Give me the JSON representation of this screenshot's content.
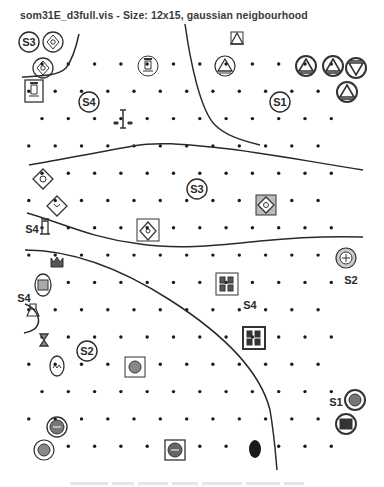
{
  "window": {
    "title": "som31E_d3full.vis - Size: 12x15, gaussian neigbourhood"
  },
  "map": {
    "grid_size": "12x15",
    "neighbourhood": "gaussian",
    "cluster_labels": [
      {
        "label": "S3",
        "x": 29,
        "y": 42,
        "circled": true
      },
      {
        "label": "S4",
        "x": 89,
        "y": 102,
        "circled": true
      },
      {
        "label": "S1",
        "x": 280,
        "y": 102,
        "circled": true
      },
      {
        "label": "S3",
        "x": 197,
        "y": 189,
        "circled": true
      },
      {
        "label": "S4",
        "x": 32,
        "y": 229,
        "circled": false
      },
      {
        "label": "S2",
        "x": 351,
        "y": 280,
        "circled": false
      },
      {
        "label": "S4",
        "x": 250,
        "y": 305,
        "circled": false
      },
      {
        "label": "S4",
        "x": 24,
        "y": 298,
        "circled": false
      },
      {
        "label": "S2",
        "x": 87,
        "y": 351,
        "circled": true
      },
      {
        "label": "S1",
        "x": 336,
        "y": 402,
        "circled": false
      }
    ],
    "glyphs": [
      {
        "type": "diamond-circle",
        "x": 53,
        "y": 42
      },
      {
        "type": "diamond-circle",
        "x": 43,
        "y": 68
      },
      {
        "type": "tower-box",
        "x": 34,
        "y": 91
      },
      {
        "type": "tower-circle",
        "x": 148,
        "y": 66
      },
      {
        "type": "tower-cross",
        "x": 123,
        "y": 119
      },
      {
        "type": "triangle-box",
        "x": 237,
        "y": 39
      },
      {
        "type": "triangle-circle",
        "x": 225,
        "y": 66
      },
      {
        "type": "triangle-circle-dark",
        "x": 306,
        "y": 66
      },
      {
        "type": "triangle-circle-dark",
        "x": 333,
        "y": 66
      },
      {
        "type": "triangle-down-circle",
        "x": 356,
        "y": 68
      },
      {
        "type": "triangle-circle-dark",
        "x": 347,
        "y": 92
      },
      {
        "type": "diamond",
        "x": 43,
        "y": 179
      },
      {
        "type": "diamond",
        "x": 57,
        "y": 206
      },
      {
        "type": "tower-small",
        "x": 45,
        "y": 228
      },
      {
        "type": "diamond-box",
        "x": 148,
        "y": 231
      },
      {
        "type": "diamond-box-dark",
        "x": 266,
        "y": 205
      },
      {
        "type": "crown",
        "x": 57,
        "y": 262
      },
      {
        "type": "seal-circle",
        "x": 346,
        "y": 258
      },
      {
        "type": "seal-oval",
        "x": 43,
        "y": 285
      },
      {
        "type": "bag-arc",
        "x": 33,
        "y": 310
      },
      {
        "type": "grid-box",
        "x": 227,
        "y": 284
      },
      {
        "type": "grid-box-dark",
        "x": 254,
        "y": 338
      },
      {
        "type": "hourglass",
        "x": 44,
        "y": 340
      },
      {
        "type": "oval-face",
        "x": 57,
        "y": 366
      },
      {
        "type": "seal-box",
        "x": 135,
        "y": 367
      },
      {
        "type": "seal-circle-dark",
        "x": 57,
        "y": 427
      },
      {
        "type": "seal-circle",
        "x": 44,
        "y": 450
      },
      {
        "type": "seal-box-dark",
        "x": 175,
        "y": 450
      },
      {
        "type": "filled-oval",
        "x": 255,
        "y": 449
      },
      {
        "type": "seal-circle-dark",
        "x": 355,
        "y": 400
      },
      {
        "type": "box-circle-dark",
        "x": 346,
        "y": 424
      }
    ],
    "boundary_lines": 5,
    "colors": {
      "line": "#2a2a2a",
      "dot": "#1a1a1a",
      "glyph": "#333333",
      "label": "#2a2a2a"
    }
  },
  "caption": {
    "text": ""
  }
}
